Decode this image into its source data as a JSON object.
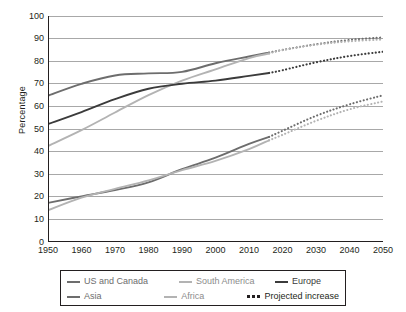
{
  "chart_data": {
    "type": "line",
    "title": "",
    "xlabel": "",
    "ylabel": "Percentage",
    "xlim": [
      1950,
      2050
    ],
    "ylim": [
      0,
      100
    ],
    "grid": true,
    "legend_position": "below",
    "x_ticks": [
      1950,
      1960,
      1970,
      1980,
      1990,
      2000,
      2010,
      2020,
      2030,
      2040,
      2050
    ],
    "y_ticks": [
      0,
      10,
      20,
      30,
      40,
      50,
      60,
      70,
      80,
      90,
      100
    ],
    "projection_start_year": 2016,
    "series": [
      {
        "name": "US and Canada",
        "color": "#6d6d6d",
        "x": [
          1950,
          1960,
          1970,
          1980,
          1990,
          2000,
          2010,
          2016,
          2020,
          2030,
          2040,
          2050
        ],
        "values": [
          64.8,
          70.0,
          73.7,
          74.6,
          75.3,
          79.1,
          82.1,
          83.8,
          85.0,
          87.5,
          89.4,
          90.5
        ]
      },
      {
        "name": "South America",
        "color": "#b3b3b3",
        "x": [
          1950,
          1960,
          1970,
          1980,
          1990,
          2000,
          2010,
          2016,
          2020,
          2030,
          2040,
          2050
        ],
        "values": [
          42.5,
          49.5,
          57.3,
          65.0,
          71.4,
          76.4,
          81.4,
          83.4,
          84.9,
          87.3,
          88.8,
          89.6
        ]
      },
      {
        "name": "Europe",
        "color": "#3b3b3b",
        "x": [
          1950,
          1960,
          1970,
          1980,
          1990,
          2000,
          2010,
          2016,
          2020,
          2030,
          2040,
          2050
        ],
        "values": [
          52.2,
          57.5,
          63.2,
          67.8,
          70.0,
          71.4,
          73.5,
          74.8,
          76.0,
          79.5,
          82.3,
          84.2
        ]
      },
      {
        "name": "Asia",
        "color": "#6d6d6d",
        "x": [
          1950,
          1960,
          1970,
          1980,
          1990,
          2000,
          2010,
          2016,
          2020,
          2030,
          2040,
          2050
        ],
        "values": [
          17.3,
          20.2,
          23.0,
          26.4,
          32.2,
          37.3,
          43.4,
          46.5,
          49.2,
          55.8,
          60.9,
          64.9
        ]
      },
      {
        "name": "Africa",
        "color": "#b3b3b3",
        "x": [
          1950,
          1960,
          1970,
          1980,
          1990,
          2000,
          2010,
          2016,
          2020,
          2030,
          2040,
          2050
        ],
        "values": [
          14.0,
          19.6,
          23.5,
          27.3,
          31.8,
          35.9,
          41.1,
          45.0,
          47.4,
          53.6,
          58.7,
          62.2
        ]
      }
    ]
  },
  "axes": {
    "ylabel": "Percentage",
    "y_ticks": [
      "0",
      "10",
      "20",
      "30",
      "40",
      "50",
      "60",
      "70",
      "80",
      "90",
      "100"
    ],
    "x_ticks": [
      "1950",
      "1960",
      "1970",
      "1980",
      "1990",
      "2000",
      "2010",
      "2020",
      "2030",
      "2040",
      "2050"
    ]
  },
  "legend": {
    "rows": [
      [
        {
          "label": "US and Canada",
          "color": "#6d6d6d",
          "style": "solid"
        },
        {
          "label": "South America",
          "color": "#b3b3b3",
          "style": "solid"
        },
        {
          "label": "Europe",
          "color": "#3b3b3b",
          "style": "solid"
        }
      ],
      [
        {
          "label": "Asia",
          "color": "#6d6d6d",
          "style": "solid"
        },
        {
          "label": "Africa",
          "color": "#b3b3b3",
          "style": "solid"
        },
        {
          "label": "Projected increase",
          "color": "#231f20",
          "style": "dotted"
        }
      ]
    ]
  },
  "style": {
    "grid_color": "#a8a8a8",
    "axis_color": "#231f20",
    "background": "#ffffff"
  }
}
